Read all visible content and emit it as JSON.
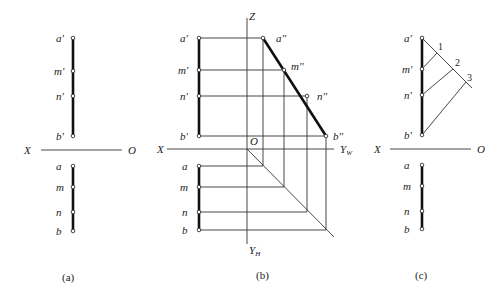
{
  "panels": {
    "a": {
      "caption": "(a)",
      "axis": {
        "left": "X",
        "right": "O"
      },
      "labels_v": [
        "a'",
        "m'",
        "n'",
        "b'"
      ],
      "labels_h": [
        "a",
        "m",
        "n",
        "b"
      ]
    },
    "b": {
      "caption": "(b)",
      "axis": {
        "left": "X",
        "origin": "O",
        "z": "Z",
        "yw": "Y",
        "yw_sub": "W",
        "yh": "Y",
        "yh_sub": "H"
      },
      "labels_v": [
        "a'",
        "m'",
        "n'",
        "b'"
      ],
      "labels_w": [
        "a''",
        "m''",
        "n''",
        "b''"
      ],
      "labels_h": [
        "a",
        "m",
        "n",
        "b"
      ]
    },
    "c": {
      "caption": "(c)",
      "axis": {
        "left": "X",
        "right": "O"
      },
      "labels_v": [
        "a'",
        "m'",
        "n'",
        "b'"
      ],
      "labels_h": [
        "a",
        "m",
        "n",
        "b"
      ],
      "construction_points": [
        "1",
        "2",
        "3"
      ]
    }
  }
}
